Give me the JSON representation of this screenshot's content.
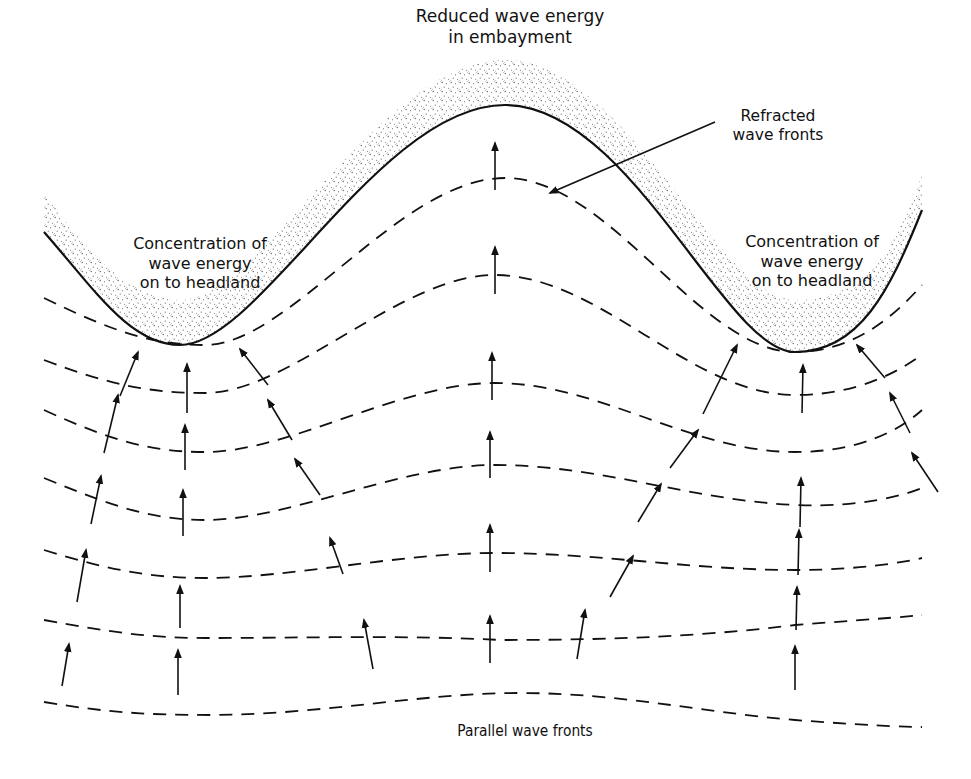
{
  "labels": {
    "embayment": [
      "Reduced wave energy",
      "in embayment"
    ],
    "refracted": [
      "Refracted",
      "wave fronts"
    ],
    "headland_left": [
      "Concentration of",
      "wave energy",
      "on to headland"
    ],
    "headland_right": [
      "Concentration of",
      "wave energy",
      "on to headland"
    ],
    "parallel": "Parallel wave fronts"
  },
  "colors": {
    "ink": "#111111",
    "background": "#ffffff",
    "stipple": "#3a3a3a"
  },
  "coastline": {
    "points": [
      [
        44,
        232
      ],
      [
        180,
        345
      ],
      [
        505,
        105
      ],
      [
        795,
        352
      ],
      [
        922,
        210
      ]
    ]
  },
  "wave_fronts": [
    {
      "id": "front-1",
      "trough_y": [
        345,
        352
      ],
      "crest_y": 178
    },
    {
      "id": "front-2",
      "trough_y": [
        390,
        395
      ],
      "crest_y": 275
    },
    {
      "id": "front-3",
      "trough_y": [
        450,
        453
      ],
      "crest_y": 383
    },
    {
      "id": "front-4",
      "trough_y": [
        522,
        520
      ],
      "crest_y": 465
    },
    {
      "id": "front-5",
      "trough_y": [
        578,
        570
      ],
      "crest_y": 553
    },
    {
      "id": "front-6",
      "trough_y": [
        638,
        633
      ],
      "crest_y": 640
    },
    {
      "id": "front-7-parallel",
      "trough_y": [
        715,
        728
      ],
      "crest_y": 695
    }
  ],
  "orthogonals": [
    {
      "id": "ray-left-outer",
      "direction": "converging-to-left-headland"
    },
    {
      "id": "ray-left-center",
      "direction": "straight-up"
    },
    {
      "id": "ray-left-inner",
      "direction": "converging-to-left-headland"
    },
    {
      "id": "ray-center",
      "direction": "straight-up-diverging"
    },
    {
      "id": "ray-right-inner",
      "direction": "converging-to-right-headland"
    },
    {
      "id": "ray-right-center",
      "direction": "straight-up"
    },
    {
      "id": "ray-right-outer",
      "direction": "converging-to-right-headland"
    }
  ]
}
